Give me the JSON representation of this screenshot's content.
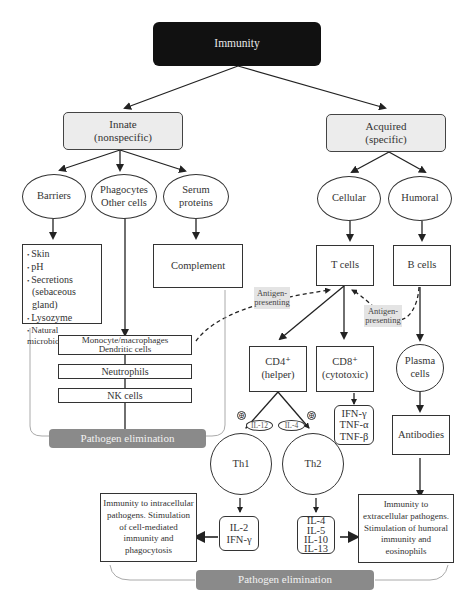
{
  "title": "Immunity",
  "branches": {
    "innate": {
      "label": "Innate",
      "sublabel": "(nonspecific)",
      "categories": {
        "barriers": "Barriers",
        "phagocytes_line1": "Phagocytes",
        "phagocytes_line2": "Other cells",
        "serum_line1": "Serum",
        "serum_line2": "proteins"
      },
      "barrier_items": [
        "Skin",
        "pH",
        "Secretions",
        "(sebaceous gland)",
        "Lysozyme",
        "Natural microbiota"
      ],
      "complement": "Complement",
      "cells": {
        "monocyte_line1": "Monocyte/macrophages",
        "monocyte_line2": "Dendritic cells",
        "neutrophils": "Neutrophils",
        "nk": "NK cells"
      },
      "outcome": "Pathogen elimination"
    },
    "acquired": {
      "label": "Acquired",
      "sublabel": "(specific)",
      "categories": {
        "cellular": "Cellular",
        "humoral": "Humoral"
      },
      "t_cells": "T cells",
      "b_cells": "B cells",
      "antigen_presenting_1_line1": "Antigen-",
      "antigen_presenting_1_line2": "presenting",
      "antigen_presenting_2_line1": "Antigen-",
      "antigen_presenting_2_line2": "presenting",
      "cd4_line1": "CD4⁺",
      "cd4_line2": "(helper)",
      "cd8_line1": "CD8⁺",
      "cd8_line2": "(cytotoxic)",
      "cd8_cytokines": [
        "IFN-γ",
        "TNF-α",
        "TNF-β"
      ],
      "plasma_line1": "Plasma",
      "plasma_line2": "cells",
      "antibodies": "Antibodies",
      "il12": "IL-12",
      "il4": "IL-4",
      "plus_symbol": "⊕",
      "th1": "Th1",
      "th2": "Th2",
      "th1_cytokines": [
        "IL-2",
        "IFN-γ"
      ],
      "th2_cytokines": [
        "IL-4",
        "IL-5",
        "IL-10",
        "IL-13"
      ],
      "th1_outcome": "Immunity to intracellular pathogens. Stimulation of cell-mediated immunity and phagocytosis",
      "th2_outcome": "Immunity to extracellular pathogens. Stimulation of humoral immunity and eosinophils",
      "outcome": "Pathogen elimination"
    }
  },
  "colors": {
    "title_bg": "#111111",
    "branch_bg": "#ececec",
    "outcome_bg": "#8a8a8a",
    "tag_bg": "#e4e4e4",
    "line": "#222222",
    "bracket": "#aaaaaa"
  }
}
